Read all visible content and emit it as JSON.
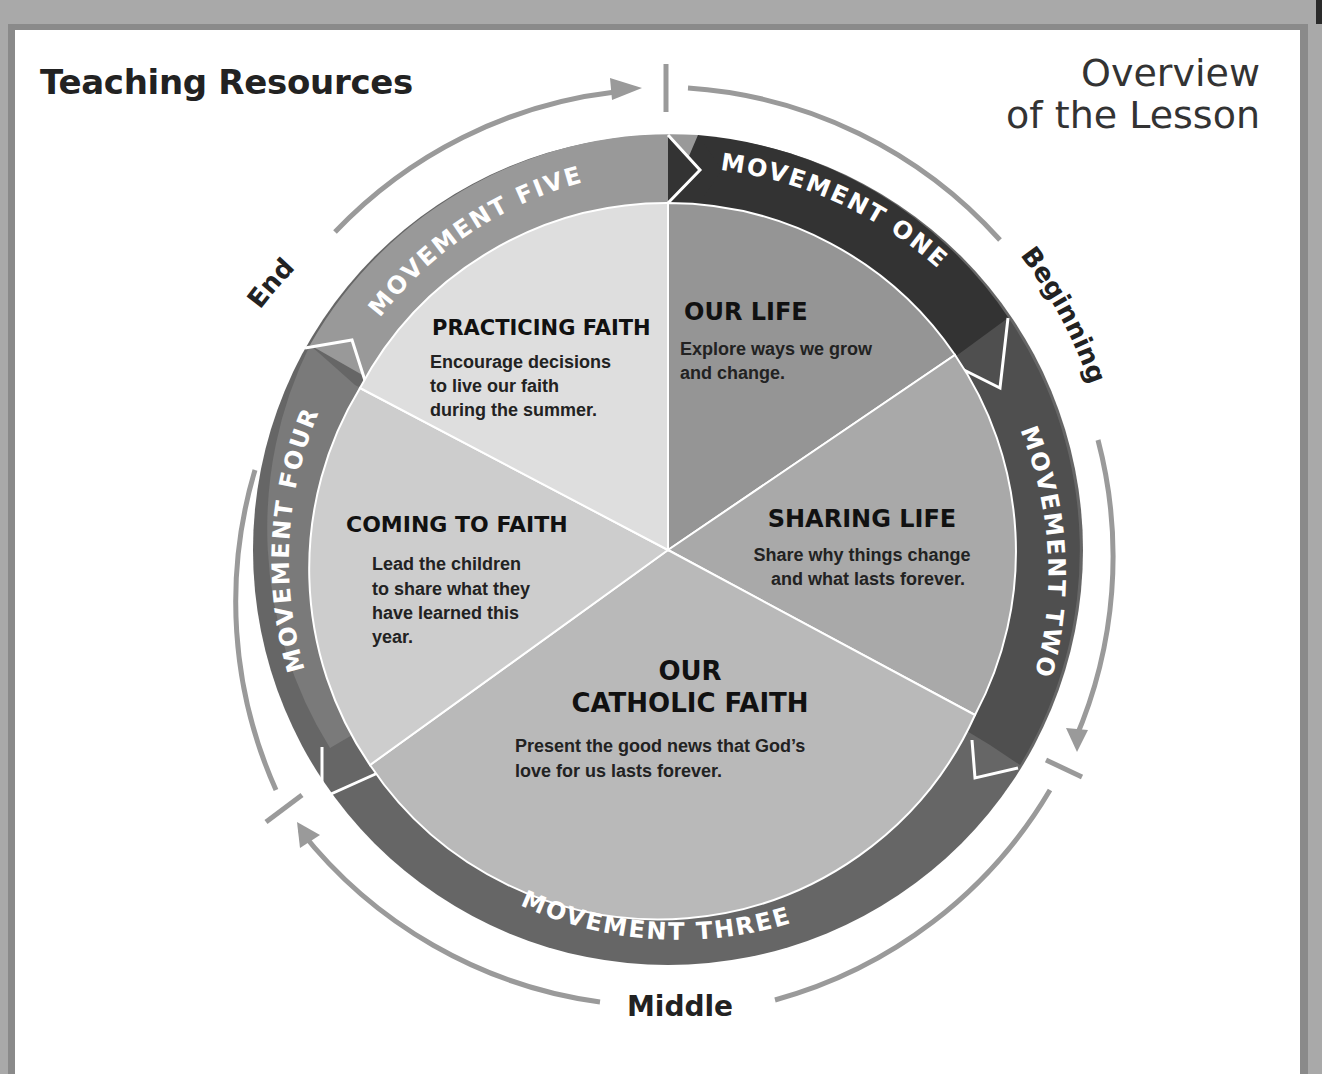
{
  "header": {
    "title": "Teaching Resources",
    "subtitle_line1": "Overview",
    "subtitle_line2": "of the Lesson"
  },
  "phases": {
    "beginning": "Beginning",
    "middle": "Middle",
    "end": "End"
  },
  "movements": [
    {
      "label": "MOVEMENT ONE",
      "color": "#3a3a3a"
    },
    {
      "label": "MOVEMENT TWO",
      "color": "#555555"
    },
    {
      "label": "MOVEMENT THREE",
      "color": "#666666"
    },
    {
      "label": "MOVEMENT FOUR",
      "color": "#7d7d7d"
    },
    {
      "label": "MOVEMENT FIVE",
      "color": "#9a9a9a"
    }
  ],
  "segments": [
    {
      "title": "OUR LIFE",
      "lines": [
        "Explore ways we grow",
        "and change."
      ],
      "color": "#959595"
    },
    {
      "title": "SHARING LIFE",
      "lines": [
        "Share why things change",
        "and what lasts forever."
      ],
      "color": "#a9a9a9"
    },
    {
      "title_line1": "OUR",
      "title_line2": "CATHOLIC FAITH",
      "lines": [
        "Present the good news that God’s",
        "love for us lasts forever."
      ],
      "color": "#b9b9b9"
    },
    {
      "title": "COMING TO FAITH",
      "lines": [
        "Lead the children",
        "to share what they",
        "have learned this",
        "year."
      ],
      "color": "#cdcdcd"
    },
    {
      "title": "PRACTICING FAITH",
      "lines": [
        "Encourage decisions",
        "to live our faith",
        "during the summer."
      ],
      "color": "#dedede"
    }
  ]
}
